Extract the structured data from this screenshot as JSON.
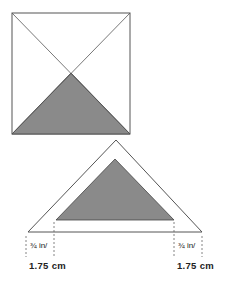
{
  "diagram": {
    "colors": {
      "line": "#555555",
      "shade": "#8a8a8a",
      "background": "#ffffff"
    },
    "square": {
      "x": 12,
      "y": 13,
      "w": 118,
      "h": 121
    },
    "seam_triangle": {
      "apex": [
        116,
        140
      ],
      "base_left": [
        28,
        232
      ],
      "base_right": [
        202,
        232
      ]
    },
    "inner_triangle": {
      "apex": [
        115,
        159
      ],
      "base_left": [
        56,
        220
      ],
      "base_right": [
        174,
        220
      ]
    },
    "labels": {
      "left_fraction": "¾ in/",
      "left_metric": "1.75 cm",
      "right_fraction": "¾ in/",
      "right_metric": "1.75 cm"
    }
  }
}
